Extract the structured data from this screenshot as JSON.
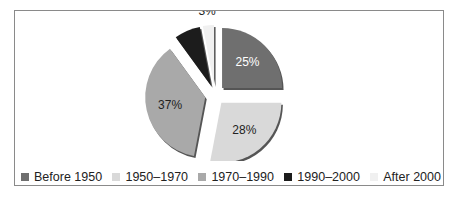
{
  "chart_data": {
    "type": "pie",
    "title": "",
    "exploded": true,
    "slices": [
      {
        "label": "Before 1950",
        "value": 25,
        "display": "25%",
        "color": "#6f6f6f",
        "text_color": "#ffffff"
      },
      {
        "label": "1950–1970",
        "value": 28,
        "display": "28%",
        "color": "#d9d9d9",
        "text_color": "#222222"
      },
      {
        "label": "1970–1990",
        "value": 37,
        "display": "37%",
        "color": "#a9a9a9",
        "text_color": "#222222"
      },
      {
        "label": "1990–2000",
        "value": 7,
        "display": "",
        "color": "#1c1c1c",
        "text_color": "#ffffff"
      },
      {
        "label": "After 2000",
        "value": 3,
        "display": "3%",
        "color": "#f0f0f0",
        "text_color": "#222222"
      }
    ],
    "legend_position": "bottom"
  },
  "legend": {
    "items": [
      "Before 1950",
      "1950–1970",
      "1970–1990",
      "1990–2000",
      "After 2000"
    ]
  }
}
